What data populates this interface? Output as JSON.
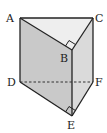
{
  "diagram": {
    "type": "triangular-prism",
    "vertices": {
      "A": {
        "label": "A",
        "x": 20,
        "y": 18
      },
      "B": {
        "label": "B",
        "x": 72,
        "y": 50
      },
      "C": {
        "label": "C",
        "x": 93,
        "y": 18
      },
      "D": {
        "label": "D",
        "x": 20,
        "y": 82
      },
      "E": {
        "label": "E",
        "x": 72,
        "y": 116
      },
      "F": {
        "label": "F",
        "x": 93,
        "y": 82
      }
    },
    "right_angles": [
      "B",
      "E"
    ],
    "hidden_edges": [
      "DF"
    ],
    "colors": {
      "face_left": "#c9c9c9",
      "face_right": "#dadada",
      "face_top": "#ececec",
      "face_bottom": "#e2e2e2",
      "edge": "#222222"
    }
  }
}
